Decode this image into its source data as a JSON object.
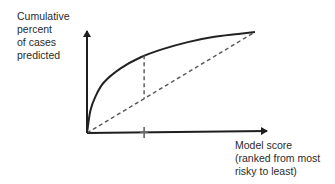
{
  "chart_data": {
    "type": "line",
    "title": "",
    "ylabel": "Cumulative\npercent\nof cases\npredicted",
    "xlabel": "Model score\n(ranked from most\nrisky to least)",
    "xlim": [
      0,
      1
    ],
    "ylim": [
      0,
      1
    ],
    "grid": false,
    "legend": null,
    "tick_labels": {
      "x": [],
      "y": []
    },
    "series": [
      {
        "name": "model gains curve",
        "style": "solid",
        "x": [
          0,
          0.02,
          0.05,
          0.1,
          0.2,
          0.32,
          0.45,
          0.6,
          0.75,
          0.9,
          1.0
        ],
        "y": [
          0,
          0.22,
          0.36,
          0.5,
          0.64,
          0.75,
          0.83,
          0.9,
          0.95,
          0.98,
          1.0
        ]
      },
      {
        "name": "random baseline",
        "style": "dashed",
        "x": [
          0,
          1
        ],
        "y": [
          0,
          1
        ]
      }
    ],
    "annotations": [
      {
        "type": "vertical-dashed-segment",
        "x": 0.34,
        "y_from": 0.34,
        "y_to": 0.77,
        "description": "gain over random at selected cutoff"
      },
      {
        "type": "x-axis-tick",
        "x": 0.34
      }
    ]
  },
  "colors": {
    "axis": "#1e1e1e",
    "curve": "#222222",
    "dashed": "#555555",
    "tick": "#666666",
    "text": "#2b2b2b"
  }
}
